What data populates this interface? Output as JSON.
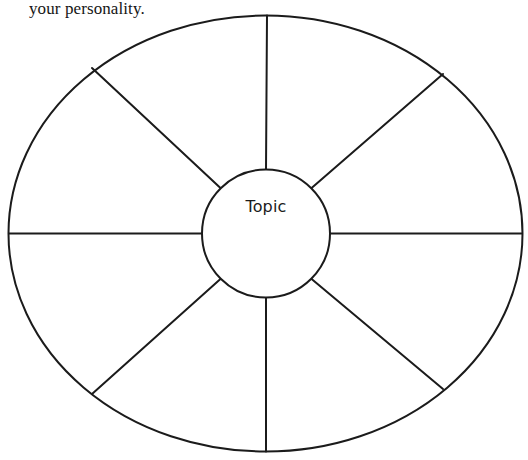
{
  "page": {
    "background_color": "#ffffff",
    "width": 528,
    "height": 460
  },
  "caption": {
    "text": "your personality."
  },
  "diagram": {
    "type": "wheel-organizer",
    "center_label": "Topic",
    "segment_count": 8,
    "stroke_color": "#1b1b1b",
    "fill_color": "#ffffff",
    "outer_ellipse": {
      "cx": 265.5,
      "cy": 233.5,
      "rx": 257,
      "ry": 218
    },
    "inner_circle": {
      "cx": 266,
      "cy": 233.5,
      "r": 64
    },
    "spokes": [
      {
        "name": "spoke-north",
        "x1": 266,
        "y1": 169.5,
        "x2": 267,
        "y2": 15.5
      },
      {
        "name": "spoke-northeast",
        "x1": 311,
        "y1": 188.5,
        "x2": 443,
        "y2": 74
      },
      {
        "name": "spoke-east",
        "x1": 330,
        "y1": 233.5,
        "x2": 522,
        "y2": 233.5
      },
      {
        "name": "spoke-southeast",
        "x1": 311,
        "y1": 278.5,
        "x2": 443,
        "y2": 389
      },
      {
        "name": "spoke-south",
        "x1": 266,
        "y1": 297.5,
        "x2": 266,
        "y2": 451.5
      },
      {
        "name": "spoke-southwest",
        "x1": 221,
        "y1": 278.5,
        "x2": 92,
        "y2": 394
      },
      {
        "name": "spoke-west",
        "x1": 202,
        "y1": 233.5,
        "x2": 9,
        "y2": 233.5
      },
      {
        "name": "spoke-northwest",
        "x1": 221,
        "y1": 188.5,
        "x2": 92,
        "y2": 68
      }
    ]
  }
}
